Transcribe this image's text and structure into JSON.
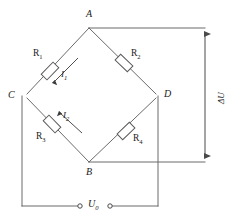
{
  "diagram": {
    "type": "circuit-schematic",
    "stroke_color": "#6b6b6b",
    "text_color": "#1a1a1a",
    "nodes": [
      {
        "id": "A",
        "label": "A",
        "x": 89,
        "y": 25
      },
      {
        "id": "C",
        "label": "C",
        "x": 22,
        "y": 96
      },
      {
        "id": "D",
        "label": "D",
        "x": 158,
        "y": 96
      },
      {
        "id": "B",
        "label": "B",
        "x": 89,
        "y": 164
      }
    ],
    "resistors": [
      {
        "id": "R1",
        "label": "R",
        "sub": "1",
        "branch": "C-A"
      },
      {
        "id": "R2",
        "label": "R",
        "sub": "2",
        "branch": "A-D"
      },
      {
        "id": "R3",
        "label": "R",
        "sub": "3",
        "branch": "C-B"
      },
      {
        "id": "R4",
        "label": "R",
        "sub": "4",
        "branch": "B-D"
      }
    ],
    "currents": [
      {
        "id": "I1",
        "label": "I",
        "sub": "1",
        "branch": "R1",
        "direction": "toward-C"
      },
      {
        "id": "I2",
        "label": "I",
        "sub": "2",
        "branch": "R3",
        "direction": "toward-C"
      }
    ],
    "measurements": [
      {
        "id": "dU",
        "label": "ΔU",
        "orientation": "vertical",
        "between": [
          "A",
          "B"
        ]
      }
    ],
    "source": {
      "id": "U0",
      "label": "U",
      "sub": "0",
      "terminals": 2
    }
  }
}
